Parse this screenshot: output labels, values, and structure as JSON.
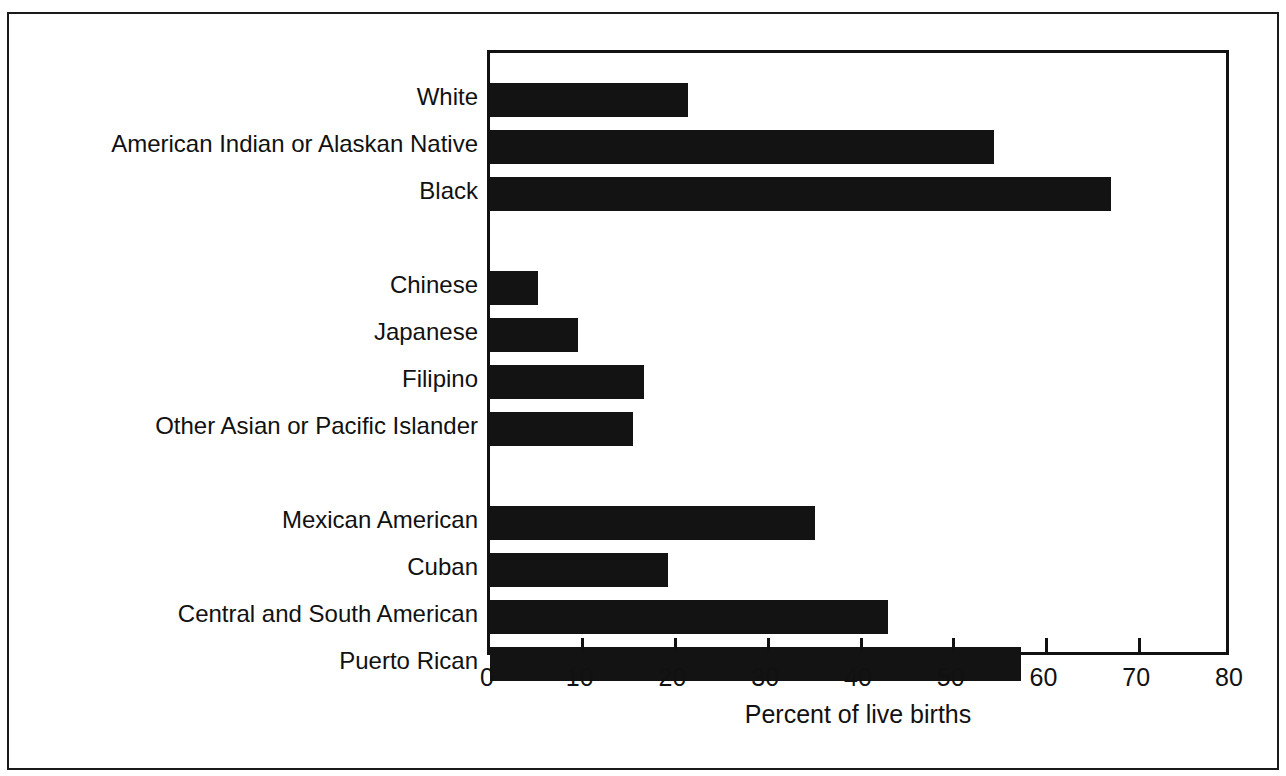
{
  "chart_data": {
    "type": "bar",
    "orientation": "horizontal",
    "title": "",
    "subtitle": "",
    "xlabel": "Percent of live births",
    "ylabel": "",
    "xlim": [
      0,
      80
    ],
    "xticks": [
      0,
      10,
      20,
      30,
      40,
      50,
      60,
      70,
      80
    ],
    "xtick_labels": [
      "0",
      "10",
      "20",
      "30",
      "40",
      "50",
      "60",
      "70",
      "80"
    ],
    "grid": false,
    "legend": null,
    "bar_color": "#131313",
    "axis_color": "#111111",
    "background_color": "#ffffff",
    "categories": [
      "White",
      "American Indian or Alaskan Native",
      "Black",
      "Chinese",
      "Japanese",
      "Filipino",
      "Other Asian or Pacific Islander",
      "Mexican American",
      "Cuban",
      "Central and South American",
      "Puerto Rican"
    ],
    "values": [
      21.3,
      54.3,
      67.0,
      5.2,
      9.5,
      16.6,
      15.4,
      35.0,
      19.2,
      42.9,
      57.2
    ],
    "group_breaks_after": [
      "Black",
      "Other Asian or Pacific Islander"
    ],
    "bars": [
      {
        "label": "White",
        "value": 21.3
      },
      {
        "label": "American Indian or Alaskan Native",
        "value": 54.3
      },
      {
        "label": "Black",
        "value": 67.0
      },
      {
        "label": "Chinese",
        "value": 5.2
      },
      {
        "label": "Japanese",
        "value": 9.5
      },
      {
        "label": "Filipino",
        "value": 16.6
      },
      {
        "label": "Other Asian or Pacific Islander",
        "value": 15.4
      },
      {
        "label": "Mexican American",
        "value": 35.0
      },
      {
        "label": "Cuban",
        "value": 19.2
      },
      {
        "label": "Central and South American",
        "value": 42.9
      },
      {
        "label": "Puerto Rican",
        "value": 57.2
      }
    ]
  }
}
